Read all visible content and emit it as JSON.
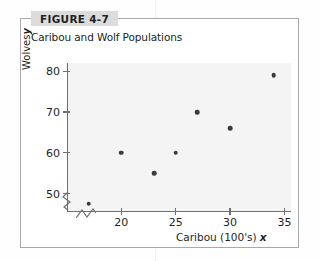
{
  "figure": {
    "tab_label": "FIGURE 4-7",
    "title": "Caribou and Wolf Populations"
  },
  "chart_data": {
    "type": "scatter",
    "title": "Caribou and Wolf Populations",
    "xlabel": "Caribou (100's)",
    "xlabel_variable": "x",
    "ylabel": "Wolves",
    "ylabel_variable": "y",
    "xlim": [
      15,
      35.6
    ],
    "ylim": [
      45.5,
      82
    ],
    "xticks": [
      20,
      25,
      30,
      35
    ],
    "yticks": [
      50,
      60,
      70,
      80
    ],
    "xtick_labels": [
      "20",
      "25",
      "30",
      "35"
    ],
    "ytick_labels": [
      "50",
      "60",
      "70",
      "80"
    ],
    "grid": false,
    "legend": null,
    "axis_break_x": true,
    "axis_break_y": true,
    "marker_color": "#3b3b3f",
    "plot_background": "#f4f4f4",
    "points": [
      {
        "x": 17.0,
        "y": 47.5
      },
      {
        "x": 20.0,
        "y": 60.0
      },
      {
        "x": 23.0,
        "y": 55.0
      },
      {
        "x": 25.0,
        "y": 60.0
      },
      {
        "x": 27.0,
        "y": 70.0
      },
      {
        "x": 30.0,
        "y": 66.0
      },
      {
        "x": 34.0,
        "y": 79.0
      }
    ]
  }
}
